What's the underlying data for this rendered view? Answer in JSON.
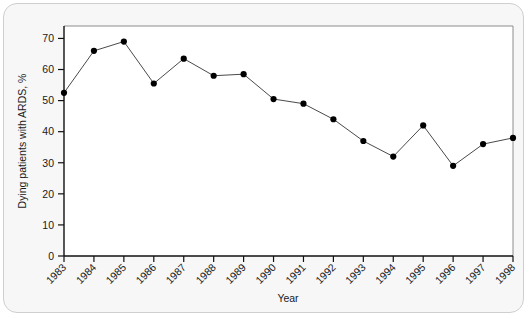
{
  "chart_data": {
    "type": "line",
    "title": "",
    "xlabel": "Year",
    "ylabel": "Dying patients with ARDS, %",
    "categories": [
      "1983",
      "1984",
      "1985",
      "1986",
      "1987",
      "1988",
      "1989",
      "1990",
      "1991",
      "1992",
      "1993",
      "1994",
      "1995",
      "1996",
      "1997",
      "1998"
    ],
    "values": [
      52.5,
      66.0,
      69.0,
      55.5,
      63.5,
      58.0,
      58.5,
      50.5,
      49.0,
      44.0,
      37.0,
      32.0,
      42.0,
      29.0,
      36.0,
      38.0
    ],
    "series": [
      {
        "name": "Dying patients with ARDS",
        "values": [
          52.5,
          66.0,
          69.0,
          55.5,
          63.5,
          58.0,
          58.5,
          50.5,
          49.0,
          44.0,
          37.0,
          32.0,
          42.0,
          29.0,
          36.0,
          38.0
        ]
      }
    ],
    "x": [
      1983,
      1984,
      1985,
      1986,
      1987,
      1988,
      1989,
      1990,
      1991,
      1992,
      1993,
      1994,
      1995,
      1996,
      1997,
      1998
    ],
    "ylim": [
      0,
      74
    ],
    "xlim": [
      1983,
      1998
    ],
    "yticks": [
      0,
      10,
      20,
      30,
      40,
      50,
      60,
      70
    ],
    "ytick_labels": [
      "0",
      "10",
      "20",
      "30",
      "40",
      "50",
      "60",
      "70"
    ],
    "xticks": [
      1983,
      1984,
      1985,
      1986,
      1987,
      1988,
      1989,
      1990,
      1991,
      1992,
      1993,
      1994,
      1995,
      1996,
      1997,
      1998
    ],
    "xtick_labels": [
      "1983",
      "1984",
      "1985",
      "1986",
      "1987",
      "1988",
      "1989",
      "1990",
      "1991",
      "1992",
      "1993",
      "1994",
      "1995",
      "1996",
      "1997",
      "1998"
    ],
    "grid": false,
    "legend": false,
    "legend_position": "none",
    "marker": "filled-circle",
    "line_color": "#4a4a4a",
    "marker_color": "#000000",
    "plot_background": "#ffffff",
    "figure_background": "#f7f7f7",
    "xtick_label_rotation": -45
  }
}
